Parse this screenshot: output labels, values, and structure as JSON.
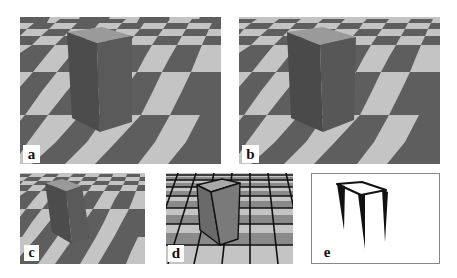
{
  "figure": {
    "panels": [
      {
        "id": "a",
        "label": "a",
        "content": "rendered box on checkerboard floor"
      },
      {
        "id": "b",
        "label": "b",
        "content": "rendered box on checkerboard floor"
      },
      {
        "id": "c",
        "label": "c",
        "content": "rendered box on checkerboard floor (smaller view)"
      },
      {
        "id": "d",
        "label": "d",
        "content": "box with black edge lines on checkerboard grid"
      },
      {
        "id": "e",
        "label": "e",
        "content": "black outline sketch of box edges"
      }
    ]
  },
  "colors": {
    "light_tile": "#c4c4c4",
    "dark_tile": "#5e5e5e",
    "box_left_face": "#4c4c4c",
    "box_right_face": "#5a5a5a",
    "box_top_face": "#9a9a9a",
    "edge_lines": "#111111"
  }
}
